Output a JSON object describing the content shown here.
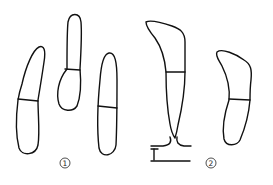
{
  "figure": {
    "colors": {
      "stroke": "#111111",
      "background": "#ffffff"
    },
    "groups": [
      {
        "id": "group-1",
        "label": "1",
        "spore_count": 3
      },
      {
        "id": "group-2",
        "label": "2",
        "spore_count": 2,
        "note": "one spore attached to a stalk on a basal hypha"
      }
    ]
  }
}
